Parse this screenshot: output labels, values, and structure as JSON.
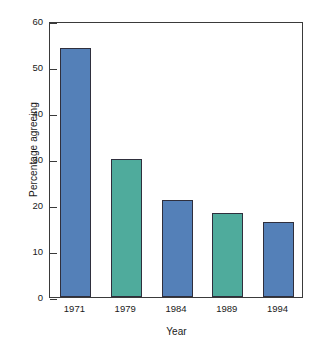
{
  "chart_data": {
    "type": "bar",
    "title": "",
    "subtitle": "",
    "xlabel": "Year",
    "ylabel": "Percentage agreeing",
    "categories": [
      "1971",
      "1979",
      "1984",
      "1989",
      "1994"
    ],
    "values": [
      54.1,
      30.1,
      21.1,
      18.2,
      16.2
    ],
    "bar_colors": [
      "#5480b8",
      "#4fab9c",
      "#5480b8",
      "#4fab9c",
      "#5480b8"
    ],
    "ylim": [
      0,
      60
    ],
    "yticks": [
      0,
      10,
      20,
      30,
      40,
      50,
      60
    ],
    "ytick_labels": [
      "0",
      "10",
      "20",
      "30",
      "40",
      "50",
      "60"
    ],
    "grid": false,
    "legend": null,
    "legend_position": "none",
    "annotations": [],
    "series": [
      {
        "name": "Percentage agreeing",
        "values": [
          54.1,
          30.1,
          21.1,
          18.2,
          16.2
        ]
      }
    ]
  },
  "style": {
    "axis_color": "#3a3a3a",
    "bar_edge_color": "#2f2f3d",
    "blue": "#5480b8",
    "teal": "#4fab9c",
    "background": "#ffffff",
    "text_color": "#1a1a1a"
  }
}
